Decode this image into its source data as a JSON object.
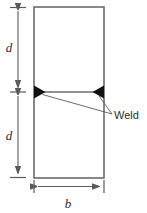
{
  "figure": {
    "type": "engineering-cross-section-diagram",
    "background_color": "#ffffff",
    "line_color": "#5a5a5a",
    "plate_outline_color": "#6b6b6b",
    "weld_fill_color": "#111111",
    "text_color": "#2b2b2b",
    "width": 147,
    "height": 213
  },
  "plate": {
    "name": "rectangular plate section",
    "left": 34,
    "right": 104,
    "top": 7,
    "bottom": 178,
    "weld_line_y": 92
  },
  "dimensions": {
    "vertical": {
      "axis_x": 18,
      "segments": [
        {
          "label": "d",
          "from_y": 7,
          "to_y": 92,
          "label_x": 9,
          "label_y": 52,
          "description": "upper half depth"
        },
        {
          "label": "d",
          "from_y": 92,
          "to_y": 178,
          "label_x": 9,
          "label_y": 140,
          "description": "lower half depth"
        }
      ]
    },
    "horizontal": {
      "axis_y": 186,
      "segments": [
        {
          "label": "b",
          "from_x": 34,
          "to_x": 104,
          "label_x": 68,
          "label_y": 207,
          "description": "plate width"
        }
      ]
    }
  },
  "annotations": [
    {
      "label": "Weld",
      "text_x": 115,
      "text_y": 118,
      "leader_origin_x": 112,
      "leader_origin_y": 114,
      "targets": [
        {
          "x": 41,
          "y": 94,
          "name": "left-weld-mark"
        },
        {
          "x": 99,
          "y": 95,
          "name": "right-weld-mark"
        }
      ]
    }
  ],
  "weld_marks": [
    {
      "name": "left-weld-triangle",
      "apex_x": 34,
      "apex_y": 87,
      "points": "34,86 34,98 45,92",
      "description": "filled triangle at left end of weld line pointing right"
    },
    {
      "name": "right-weld-triangle",
      "apex_x": 104,
      "apex_y": 87,
      "points": "104,86 104,98 93,92",
      "description": "filled triangle at right end of weld line pointing left"
    }
  ]
}
